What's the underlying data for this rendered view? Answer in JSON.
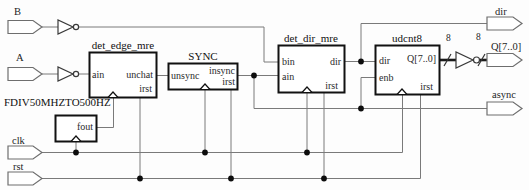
{
  "diagram": {
    "kind": "rtl-schematic",
    "background": "#fdfdfd",
    "wire_color": "#7a7a7a",
    "block_border_color": "#111111"
  },
  "inputs": {
    "b": "B",
    "a": "A",
    "clk": "clk",
    "rst": "rst"
  },
  "outputs": {
    "dir": "dir",
    "q": "Q[7..0]",
    "async": "async"
  },
  "bus": {
    "width_labels": [
      "8",
      "8"
    ]
  },
  "blocks": {
    "det_edge_mre": {
      "title": "det_edge_mre",
      "ports": {
        "ain": "ain",
        "unchat": "unchat",
        "irst": "irst"
      }
    },
    "sync": {
      "title": "SYNC",
      "ports": {
        "unsync": "unsync",
        "insync": "insync",
        "irst": "irst"
      }
    },
    "det_dir_mre": {
      "title": "det_dir_mre",
      "ports": {
        "bin": "bin",
        "ain": "ain",
        "dir": "dir",
        "irst": "irst"
      }
    },
    "udcnt8": {
      "title": "udcnt8",
      "ports": {
        "dir": "dir",
        "enb": "enb",
        "q": "Q[7..0]",
        "irst": "irst"
      }
    },
    "fdiv": {
      "title": "FDIV50MHZTO500HZ",
      "ports": {
        "fout": "fout"
      }
    }
  }
}
